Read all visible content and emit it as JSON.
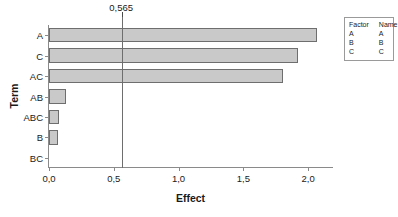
{
  "chart_data": {
    "type": "bar",
    "orientation": "horizontal",
    "title": "",
    "xlabel": "Effect",
    "ylabel": "Term",
    "categories": [
      "A",
      "C",
      "AC",
      "AB",
      "ABC",
      "B",
      "BC"
    ],
    "values": [
      2.07,
      1.92,
      1.81,
      0.13,
      0.075,
      0.07,
      0.0
    ],
    "xlim": [
      0.0,
      2.2
    ],
    "xticks": [
      0.0,
      0.5,
      1.0,
      1.5,
      2.0
    ],
    "xtick_labels": [
      "0,0",
      "0,5",
      "1,0",
      "1,5",
      "2,0"
    ],
    "grid": false,
    "legend_position": "right",
    "reference_line": {
      "value": 0.565,
      "label": "0,565"
    },
    "bar_fill_color": "#c9c9c9",
    "bar_edge_color": "#6e6e6e",
    "axis_color": "#8a8a8a"
  },
  "legend": {
    "headers": [
      "Factor",
      "Name"
    ],
    "rows": [
      {
        "factor": "A",
        "name": "A"
      },
      {
        "factor": "B",
        "name": "B"
      },
      {
        "factor": "C",
        "name": "C"
      }
    ]
  }
}
